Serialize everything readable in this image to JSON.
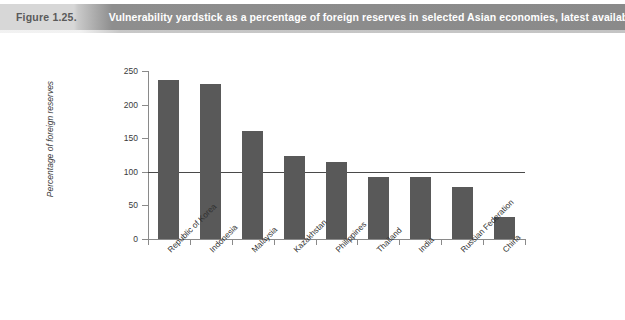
{
  "banner": {
    "figure_number": "Figure 1.25.",
    "title": "Vulnerability yardstick as a percentage of foreign reserves in selected Asian economies, latest available data",
    "left_bg_color": "#d7d7d7",
    "right_bg_color": "#8a8a8a",
    "title_color": "#ffffff",
    "number_color": "#5a5a5a"
  },
  "chart_data": {
    "type": "bar",
    "title": "Vulnerability yardstick as a percentage of foreign reserves in selected Asian economies, latest available data",
    "xlabel": "",
    "ylabel": "Percentage of foreign reserves",
    "categories": [
      "Republic of Korea",
      "Indonesia",
      "Malaysia",
      "Kazakhstan",
      "Philippines",
      "Thailand",
      "India",
      "Russian Federation",
      "China"
    ],
    "values": [
      237,
      231,
      160,
      124,
      115,
      92,
      92,
      78,
      32
    ],
    "ylim": [
      0,
      250
    ],
    "yticks": [
      0,
      50,
      100,
      150,
      200,
      250
    ],
    "ytick_labels": [
      "0",
      "50",
      "100",
      "150",
      "200",
      "250"
    ],
    "grid": false,
    "legend": "none",
    "bar_color": "#595959",
    "reference_line": {
      "value": 100,
      "color": "#4a4a4a",
      "label": ""
    }
  }
}
